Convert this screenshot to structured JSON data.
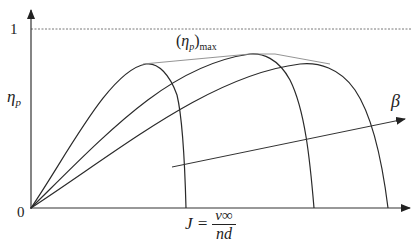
{
  "diagram": {
    "y_axis": {
      "label": "η",
      "label_sub": "p",
      "tick_one": "1"
    },
    "x_axis": {
      "origin": "0",
      "label_lhs": "J =",
      "label_num": "v∞",
      "label_den": "nd"
    },
    "envelope_label": {
      "open": "(",
      "eta": "η",
      "sub": "p",
      "close": ")",
      "max": "max"
    },
    "beta_label": "β",
    "colors": {
      "curve": "#2a2a2a",
      "axis": "#333333",
      "envelope": "#888888",
      "dashed": "#555555"
    },
    "curves": [
      {
        "name": "curve-beta-low",
        "peak": [
          150,
          64
        ],
        "end_x": 186
      },
      {
        "name": "curve-beta-mid",
        "peak": [
          253,
          54
        ],
        "end_x": 314
      },
      {
        "name": "curve-beta-high",
        "peak": [
          322,
          63
        ],
        "end_x": 388
      }
    ]
  }
}
